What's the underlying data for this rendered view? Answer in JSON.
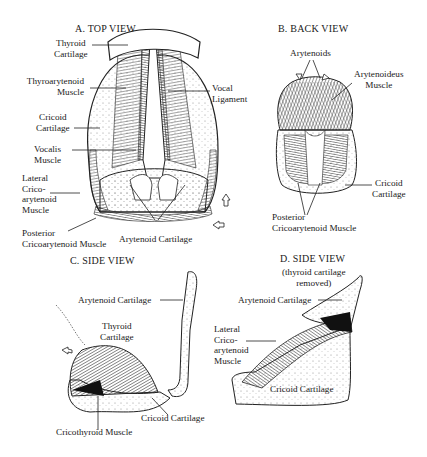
{
  "figure": {
    "panels": [
      {
        "id": "A",
        "title": "A.  TOP VIEW",
        "labels": {
          "thyroid_cartilage": [
            "Thyroid",
            "Cartilage"
          ],
          "thyroarytenoid_muscle": [
            "Thyroarytenoid",
            "Muscle"
          ],
          "cricoid_cartilage": [
            "Cricoid",
            "Cartilage"
          ],
          "vocalis_muscle": [
            "Vocalis",
            "Muscle"
          ],
          "lateral_cricoarytenoid_muscle": [
            "Lateral",
            "Crico-",
            "arytenoid",
            "Muscle"
          ],
          "vocal_ligament": [
            "Vocal",
            "Ligament"
          ],
          "posterior_cricoarytenoid_muscle": [
            "Posterior",
            "Cricoarytenoid Muscle"
          ],
          "arytenoid_cartilage": "Arytenoid Cartilage"
        }
      },
      {
        "id": "B",
        "title": "B.  BACK VIEW",
        "labels": {
          "arytenoids": "Arytenoids",
          "arytenoideus_muscle": [
            "Arytenoideus",
            "Muscle"
          ],
          "cricoid_cartilage": [
            "Cricoid",
            "Cartilage"
          ],
          "posterior_cricoarytenoid_muscle": [
            "Posterior",
            "Cricoarytenoid Muscle"
          ]
        }
      },
      {
        "id": "C",
        "title": "C.  SIDE VIEW",
        "labels": {
          "arytenoid_cartilage": "Arytenoid Cartilage",
          "thyroid_cartilage": [
            "Thyroid",
            "Cartilage"
          ],
          "cricoid_cartilage": "Cricoid Cartilage",
          "cricothyroid_muscle": "Cricothyroid Muscle"
        }
      },
      {
        "id": "D",
        "title": "D.  SIDE VIEW",
        "subtitle": [
          "(thyroid cartilage",
          "removed)"
        ],
        "labels": {
          "arytenoid_cartilage": "Arytenoid Cartilage",
          "lateral_cricoarytenoid_muscle": [
            "Lateral",
            "Crico-",
            "arytenoid",
            "Muscle"
          ],
          "cricoid_cartilage": "Cricoid Cartilage"
        }
      }
    ]
  }
}
